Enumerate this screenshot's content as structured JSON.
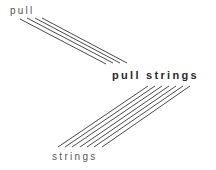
{
  "labels": {
    "top": "pull",
    "middle": "pull strings",
    "bottom": "strings"
  },
  "colors": {
    "line": "#4a4a4a",
    "text": "#555555",
    "text_bold": "#2a2a2a",
    "background": "#ffffff"
  },
  "line_groups": {
    "top": {
      "count": 4,
      "lines": [
        {
          "x1": 20,
          "y1": 19,
          "x2": 106,
          "y2": 64
        },
        {
          "x1": 27,
          "y1": 18,
          "x2": 113,
          "y2": 63
        },
        {
          "x1": 35,
          "y1": 18,
          "x2": 120,
          "y2": 63
        },
        {
          "x1": 42,
          "y1": 18,
          "x2": 127,
          "y2": 63
        }
      ]
    },
    "bottom": {
      "count": 7,
      "lines": [
        {
          "x1": 58,
          "y1": 147,
          "x2": 148,
          "y2": 86
        },
        {
          "x1": 65,
          "y1": 147,
          "x2": 155,
          "y2": 86
        },
        {
          "x1": 72,
          "y1": 147,
          "x2": 162,
          "y2": 86
        },
        {
          "x1": 80,
          "y1": 147,
          "x2": 169,
          "y2": 86
        },
        {
          "x1": 87,
          "y1": 147,
          "x2": 176,
          "y2": 86
        },
        {
          "x1": 94,
          "y1": 147,
          "x2": 183,
          "y2": 86
        },
        {
          "x1": 102,
          "y1": 147,
          "x2": 190,
          "y2": 86
        }
      ]
    }
  }
}
